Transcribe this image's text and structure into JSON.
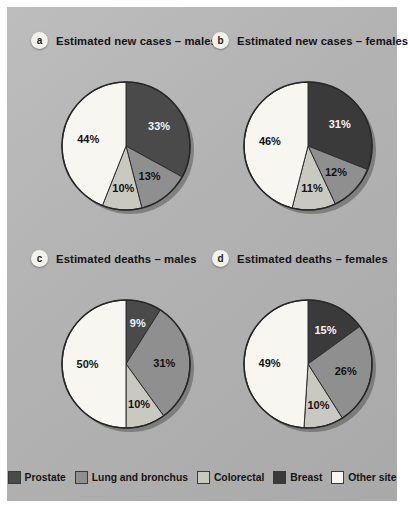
{
  "figure": {
    "panel_background": "#b4b4b4",
    "page_background": "#ffffff"
  },
  "series_colors": {
    "prostate": "#4a4a4a",
    "lung_and_bronchus": "#8f8f8f",
    "colorectal": "#c9c9c2",
    "breast": "#3a3a3a",
    "other_site": "#f7f6f1"
  },
  "panels": [
    {
      "badge": "a",
      "title": "Estimated new cases – males",
      "labels": [
        "33%",
        "13%",
        "10%",
        "44%"
      ]
    },
    {
      "badge": "b",
      "title": "Estimated new cases – females",
      "labels": [
        "31%",
        "12%",
        "11%",
        "46%"
      ]
    },
    {
      "badge": "c",
      "title": "Estimated deaths – males",
      "labels": [
        "9%",
        "31%",
        "10%",
        "50%"
      ]
    },
    {
      "badge": "d",
      "title": "Estimated deaths – females",
      "labels": [
        "15%",
        "26%",
        "10%",
        "49%"
      ]
    }
  ],
  "legend": {
    "items": [
      {
        "label": "Prostate",
        "color": "#4a4a4a"
      },
      {
        "label": "Lung and bronchus",
        "color": "#8f8f8f"
      },
      {
        "label": "Colorectal",
        "color": "#c9c9c2"
      },
      {
        "label": "Breast",
        "color": "#3a3a3a"
      },
      {
        "label": "Other site",
        "color": "#f7f6f1"
      }
    ]
  },
  "chart_data": [
    {
      "type": "pie",
      "panel": "a",
      "title": "Estimated new cases – males",
      "categories": [
        "Prostate",
        "Lung and bronchus",
        "Colorectal",
        "Other site"
      ],
      "values": [
        33,
        13,
        10,
        44
      ],
      "value_labels": [
        "33%",
        "13%",
        "10%",
        "44%"
      ],
      "colors": [
        "#4a4a4a",
        "#8f8f8f",
        "#c9c9c2",
        "#f7f6f1"
      ],
      "units": "percent",
      "start_angle_deg": 0,
      "direction": "clockwise",
      "legend_position": "bottom"
    },
    {
      "type": "pie",
      "panel": "b",
      "title": "Estimated new cases – females",
      "categories": [
        "Breast",
        "Lung and bronchus",
        "Colorectal",
        "Other site"
      ],
      "values": [
        31,
        12,
        11,
        46
      ],
      "value_labels": [
        "31%",
        "12%",
        "11%",
        "46%"
      ],
      "colors": [
        "#3a3a3a",
        "#8f8f8f",
        "#c9c9c2",
        "#f7f6f1"
      ],
      "units": "percent",
      "start_angle_deg": 0,
      "direction": "clockwise",
      "legend_position": "bottom"
    },
    {
      "type": "pie",
      "panel": "c",
      "title": "Estimated deaths – males",
      "categories": [
        "Prostate",
        "Lung and bronchus",
        "Colorectal",
        "Other site"
      ],
      "values": [
        9,
        31,
        10,
        50
      ],
      "value_labels": [
        "9%",
        "31%",
        "10%",
        "50%"
      ],
      "colors": [
        "#4a4a4a",
        "#8f8f8f",
        "#c9c9c2",
        "#f7f6f1"
      ],
      "units": "percent",
      "start_angle_deg": 0,
      "direction": "clockwise",
      "legend_position": "bottom"
    },
    {
      "type": "pie",
      "panel": "d",
      "title": "Estimated deaths – females",
      "categories": [
        "Breast",
        "Lung and bronchus",
        "Colorectal",
        "Other site"
      ],
      "values": [
        15,
        26,
        10,
        49
      ],
      "value_labels": [
        "15%",
        "26%",
        "10%",
        "49%"
      ],
      "colors": [
        "#3a3a3a",
        "#8f8f8f",
        "#c9c9c2",
        "#f7f6f1"
      ],
      "units": "percent",
      "start_angle_deg": 0,
      "direction": "clockwise",
      "legend_position": "bottom"
    }
  ]
}
